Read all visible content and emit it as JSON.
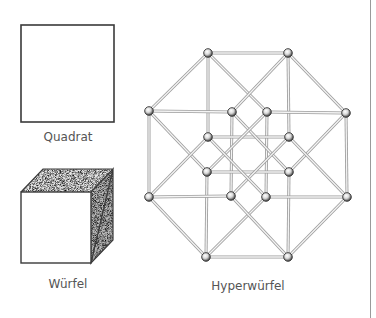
{
  "figures": {
    "square": {
      "label": "Quadrat",
      "rect": {
        "x": 21,
        "y": 25,
        "w": 93,
        "h": 97
      }
    },
    "cube": {
      "label": "Würfel",
      "front": {
        "x": 21,
        "y": 192,
        "w": 70,
        "h": 71
      },
      "depth_offset": {
        "dx": 22,
        "dy": -23
      }
    },
    "hypercube": {
      "label": "Hyperwürfel",
      "vertices": [
        {
          "id": "A1",
          "x": 208,
          "y": 53
        },
        {
          "id": "A2",
          "x": 288,
          "y": 53
        },
        {
          "id": "A3",
          "x": 346,
          "y": 113
        },
        {
          "id": "A4",
          "x": 347,
          "y": 197
        },
        {
          "id": "A5",
          "x": 288,
          "y": 257
        },
        {
          "id": "A6",
          "x": 206,
          "y": 257
        },
        {
          "id": "A7",
          "x": 149,
          "y": 197
        },
        {
          "id": "A8",
          "x": 149,
          "y": 111
        },
        {
          "id": "B1",
          "x": 232,
          "y": 112
        },
        {
          "id": "B2",
          "x": 267,
          "y": 112
        },
        {
          "id": "B3",
          "x": 289,
          "y": 137
        },
        {
          "id": "B4",
          "x": 289,
          "y": 172
        },
        {
          "id": "B5",
          "x": 266,
          "y": 197
        },
        {
          "id": "B6",
          "x": 231,
          "y": 196
        },
        {
          "id": "B7",
          "x": 207,
          "y": 172
        },
        {
          "id": "B8",
          "x": 208,
          "y": 137
        }
      ],
      "edges": [
        [
          "A1",
          "A2"
        ],
        [
          "A2",
          "A3"
        ],
        [
          "A3",
          "A4"
        ],
        [
          "A4",
          "A5"
        ],
        [
          "A5",
          "A6"
        ],
        [
          "A6",
          "A7"
        ],
        [
          "A7",
          "A8"
        ],
        [
          "A8",
          "A1"
        ],
        [
          "A1",
          "B8"
        ],
        [
          "A2",
          "B3"
        ],
        [
          "A6",
          "B7"
        ],
        [
          "A5",
          "B4"
        ],
        [
          "A8",
          "B1"
        ],
        [
          "A3",
          "B2"
        ],
        [
          "A7",
          "B6"
        ],
        [
          "A4",
          "B5"
        ],
        [
          "A1",
          "B2"
        ],
        [
          "A2",
          "B1"
        ],
        [
          "A8",
          "B7"
        ],
        [
          "A7",
          "B8"
        ],
        [
          "A3",
          "B4"
        ],
        [
          "A4",
          "B3"
        ],
        [
          "A6",
          "B5"
        ],
        [
          "A5",
          "B6"
        ],
        [
          "B1",
          "B6"
        ],
        [
          "B2",
          "B5"
        ],
        [
          "B8",
          "B3"
        ],
        [
          "B7",
          "B4"
        ],
        [
          "B1",
          "B4"
        ],
        [
          "B2",
          "B7"
        ],
        [
          "B3",
          "B6"
        ],
        [
          "B8",
          "B5"
        ]
      ]
    }
  },
  "colors": {
    "outline": "#3a3a3a",
    "label": "#555555",
    "rod": "#9c9c9c",
    "divider": "#9a9a9a",
    "top_face": "#d6d6d6",
    "side_face": "#9e9e9e"
  }
}
